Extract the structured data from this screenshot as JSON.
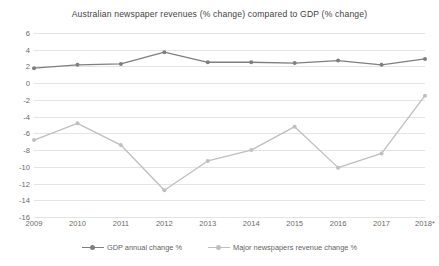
{
  "chart_data": {
    "type": "line",
    "title": "Australian newspaper revenues (% change) compared to GDP (% change)",
    "xlabel": "",
    "ylabel": "",
    "categories": [
      "2009",
      "2010",
      "2011",
      "2012",
      "2013",
      "2014",
      "2015",
      "2016",
      "2017",
      "2018*"
    ],
    "ylim": [
      -16,
      6
    ],
    "yticks": [
      6,
      4,
      2,
      0,
      -2,
      -4,
      -6,
      -8,
      -10,
      -12,
      -14,
      -16
    ],
    "ytick_labels": [
      "6",
      "4",
      "2",
      "0",
      "-2",
      "-4",
      "-6",
      "-8",
      "-10",
      "-12",
      "-14",
      "-16"
    ],
    "grid": true,
    "legend_position": "bottom",
    "series": [
      {
        "name": "GDP annual change %",
        "color": "#7f7f7f",
        "marker": "circle",
        "values": [
          1.8,
          2.2,
          2.3,
          3.7,
          2.5,
          2.5,
          2.4,
          2.7,
          2.2,
          2.9
        ]
      },
      {
        "name": "Major newspapers revenue change %",
        "color": "#bfbfbf",
        "marker": "circle",
        "values": [
          -6.8,
          -4.8,
          -7.4,
          -12.8,
          -9.3,
          -8.0,
          -5.2,
          -10.1,
          -8.4,
          -1.5
        ]
      }
    ]
  },
  "colors": {
    "background": "#ffffff",
    "grid": "#e4e4e4",
    "text": "#6a6a6a",
    "title_text": "#3f3f3f",
    "series_gdp": "#7f7f7f",
    "series_newspapers": "#bfbfbf"
  }
}
